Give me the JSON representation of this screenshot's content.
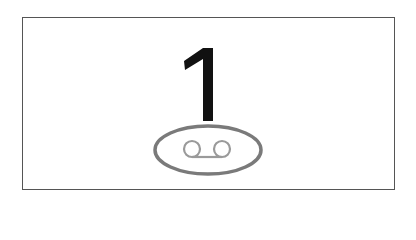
{
  "key": {
    "digit": "1",
    "sub_icon": "voicemail-icon",
    "colors": {
      "border": "#555555",
      "digit": "#111111",
      "ellipse": "#7a7a7a",
      "voicemail": "#9a9a9a"
    }
  }
}
